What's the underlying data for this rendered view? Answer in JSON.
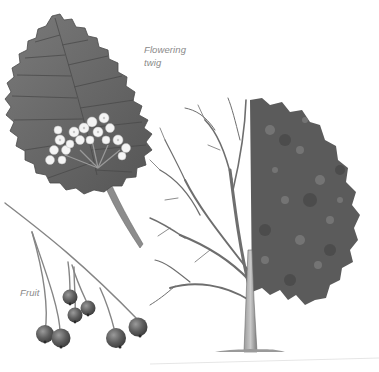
{
  "illustration": {
    "subject": "Botanical plate: tree species illustration",
    "labels": {
      "flowering_line1": "Flowering",
      "flowering_line2": "twig",
      "fruit": "Fruit"
    },
    "parts": [
      {
        "name": "flowering-twig",
        "description": "Serrated leaf with white flower cluster and stem"
      },
      {
        "name": "fruit-twig",
        "description": "Drooping branch bearing seven round berries"
      },
      {
        "name": "tree",
        "description": "Whole tree shown half bare (winter) and half in leaf (summer)"
      }
    ],
    "colors": {
      "background": "#ffffff",
      "leaf": "#6b6b6b",
      "leaf_dark": "#4e4e4e",
      "flower": "#f2f2f2",
      "berry": "#5c5c5c",
      "branch": "#7a7a7a",
      "foliage": "#5a5a5a",
      "label": "#8a8a8a"
    }
  }
}
